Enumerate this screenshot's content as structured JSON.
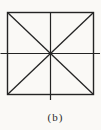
{
  "figure": {
    "caption": "(b)",
    "line_color": "#242424",
    "paper_color": "#faf9f6",
    "caption_color": "#2a2a2a"
  }
}
